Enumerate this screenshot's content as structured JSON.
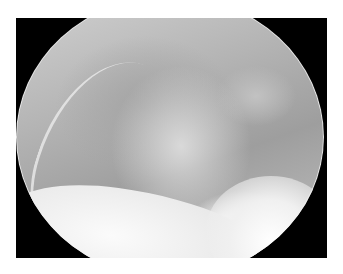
{
  "image": {
    "description": "Grayscale endoscopic/arthroscopic view within a circular field on a black rectangular frame",
    "frame_color": "#000000",
    "background_color": "#ffffff"
  },
  "caption": {
    "text": ""
  }
}
